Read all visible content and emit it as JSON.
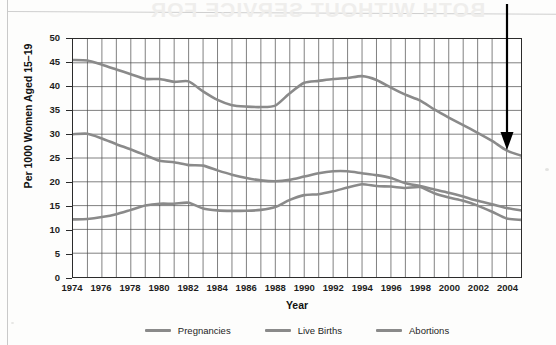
{
  "page": {
    "ghost_text": "BOTH WITHOUT SERVICE FOR",
    "left_rule": true
  },
  "chart_data": {
    "type": "line",
    "title": "",
    "xlabel": "Year",
    "ylabel": "Per 1000 Women Aged 15–19",
    "xlim": [
      1974,
      2005
    ],
    "ylim": [
      0,
      50
    ],
    "ytick_step": 5,
    "yticks": [
      0,
      5,
      10,
      15,
      20,
      25,
      30,
      35,
      40,
      45,
      50
    ],
    "xticks": [
      1974,
      1976,
      1978,
      1980,
      1982,
      1984,
      1986,
      1988,
      1990,
      1992,
      1994,
      1996,
      1998,
      2000,
      2002,
      2004
    ],
    "xtick_labels": [
      "1974",
      "1976",
      "1978",
      "1980",
      "1982",
      "1984",
      "1986",
      "1988",
      "1990",
      "1992",
      "1994",
      "1996",
      "1998",
      "2000",
      "2002",
      "2004"
    ],
    "ytick_labels": [
      "0",
      "5",
      "10",
      "15",
      "20",
      "25",
      "30",
      "35",
      "40",
      "45",
      "50"
    ],
    "grid": true,
    "grid_minor_x": "every year",
    "legend_position": "below",
    "x": [
      1974,
      1975,
      1976,
      1977,
      1978,
      1979,
      1980,
      1981,
      1982,
      1983,
      1984,
      1985,
      1986,
      1987,
      1988,
      1989,
      1990,
      1991,
      1992,
      1993,
      1994,
      1995,
      1996,
      1997,
      1998,
      1999,
      2000,
      2001,
      2002,
      2003,
      2004,
      2005
    ],
    "series": [
      {
        "name": "Pregnancies",
        "color": "#8a8a8a",
        "values": [
          45.6,
          45.5,
          44.6,
          43.6,
          42.6,
          41.6,
          41.6,
          41.0,
          41.1,
          39.0,
          37.2,
          36.1,
          35.8,
          35.7,
          36.0,
          38.6,
          40.8,
          41.2,
          41.6,
          41.8,
          42.2,
          41.4,
          39.8,
          38.3,
          37.1,
          35.2,
          33.5,
          31.9,
          30.3,
          28.6,
          26.6,
          25.5
        ]
      },
      {
        "name": "Live Births",
        "color": "#8a8a8a",
        "values": [
          30.0,
          30.1,
          29.1,
          27.9,
          26.8,
          25.6,
          24.4,
          24.1,
          23.5,
          23.4,
          22.4,
          21.5,
          20.8,
          20.3,
          20.1,
          20.4,
          21.1,
          21.8,
          22.2,
          22.2,
          21.8,
          21.4,
          20.8,
          19.7,
          19.1,
          18.4,
          17.7,
          16.9,
          16.0,
          15.3,
          14.5,
          14.0
        ]
      },
      {
        "name": "Abortions",
        "color": "#8a8a8a",
        "values": [
          12.1,
          12.2,
          12.6,
          13.2,
          14.1,
          15.0,
          15.4,
          15.4,
          15.6,
          14.4,
          14.0,
          13.9,
          13.9,
          14.1,
          14.7,
          16.2,
          17.2,
          17.4,
          18.0,
          18.8,
          19.5,
          19.1,
          19.0,
          18.7,
          18.9,
          17.6,
          16.7,
          16.0,
          15.0,
          13.7,
          12.3,
          12.0
        ]
      }
    ],
    "annotation": {
      "type": "arrow",
      "direction": "down",
      "target_series": "Pregnancies",
      "target_x": 2004,
      "target_y": 26.6,
      "color": "#000000"
    }
  },
  "legend": {
    "items": [
      {
        "label": "Pregnancies",
        "color": "#8a8a8a"
      },
      {
        "label": "Live Births",
        "color": "#8a8a8a"
      },
      {
        "label": "Abortions",
        "color": "#8a8a8a"
      }
    ]
  }
}
